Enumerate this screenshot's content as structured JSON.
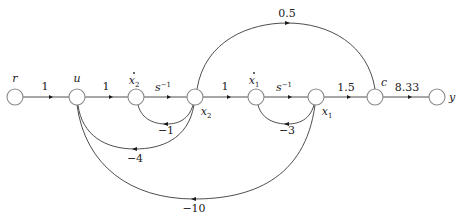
{
  "diagram": {
    "type": "signal-flow-graph",
    "nodes": [
      {
        "id": "r",
        "label": "r",
        "cx": 15,
        "cy": 97
      },
      {
        "id": "u",
        "label": "u",
        "cx": 77,
        "cy": 97
      },
      {
        "id": "x2dot",
        "label": "x",
        "sub": "2",
        "dot": true,
        "cx": 136,
        "cy": 97
      },
      {
        "id": "x2",
        "label": "x",
        "sub": "2",
        "cx": 195,
        "cy": 97
      },
      {
        "id": "x1dot",
        "label": "x",
        "sub": "1",
        "dot": true,
        "cx": 256,
        "cy": 97
      },
      {
        "id": "x1",
        "label": "x",
        "sub": "1",
        "cx": 316,
        "cy": 97
      },
      {
        "id": "c",
        "label": "c",
        "cx": 375,
        "cy": 97
      },
      {
        "id": "y",
        "label": "y",
        "cx": 437,
        "cy": 97
      }
    ],
    "branches": [
      {
        "from": "r",
        "to": "u",
        "gain": "1"
      },
      {
        "from": "u",
        "to": "x2dot",
        "gain": "1"
      },
      {
        "from": "x2dot",
        "to": "x2",
        "gain": "s",
        "gain_sup": "−1"
      },
      {
        "from": "x2",
        "to": "x1dot",
        "gain": "1"
      },
      {
        "from": "x1dot",
        "to": "x1",
        "gain": "s",
        "gain_sup": "−1"
      },
      {
        "from": "x1",
        "to": "c",
        "gain": "1.5"
      },
      {
        "from": "c",
        "to": "y",
        "gain": "8.33"
      },
      {
        "from": "x2",
        "to": "c",
        "gain": "0.5"
      },
      {
        "from": "x2",
        "to": "x2dot",
        "gain": "−1"
      },
      {
        "from": "x2",
        "to": "u",
        "gain": "−4"
      },
      {
        "from": "x1",
        "to": "x1dot",
        "gain": "−3"
      },
      {
        "from": "x1",
        "to": "u",
        "gain": "−10"
      }
    ]
  },
  "labels": {
    "r": "r",
    "u": "u",
    "x": "x",
    "c": "c",
    "y": "y",
    "sub1": "1",
    "sub2": "2",
    "s": "s",
    "sup_neg1": "−1",
    "g_r_u": "1",
    "g_u_x2dot": "1",
    "g_x2_x1dot": "1",
    "g_x1_c": "1.5",
    "g_c_y": "8.33",
    "g_x2_c": "0.5",
    "g_x2_x2dot": "−1",
    "g_x2_u": "−4",
    "g_x1_x1dot": "−3",
    "g_x1_u": "−10"
  },
  "colors": {
    "node_stroke": "#8a8a8a",
    "branch": "#3a3a3a",
    "text": "#222222",
    "background": "#ffffff"
  }
}
